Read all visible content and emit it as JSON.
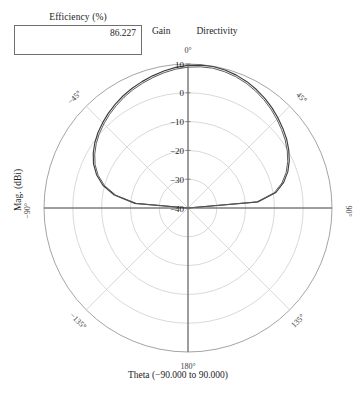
{
  "efficiency": {
    "title": "Efficiency (%)",
    "value": "86.227"
  },
  "legend": {
    "items": [
      {
        "label": "Gain",
        "color": "#555555"
      },
      {
        "label": "Directivity",
        "color": "#3d3d3d"
      }
    ]
  },
  "axes": {
    "x_title": "Theta (−90.000 to 90.000)",
    "y_title": "Mag. (dBi)"
  },
  "chart_data": {
    "type": "line",
    "subtype": "polar",
    "title": "",
    "xlabel": "Theta (−90.000 to 90.000)",
    "ylabel": "Mag. (dBi)",
    "radial_ticks": [
      10,
      0,
      -10,
      -20,
      -30,
      -40
    ],
    "radial_tick_labels": [
      "10",
      "0",
      "−10",
      "−20",
      "−30",
      "−40"
    ],
    "rlim": [
      -40,
      10
    ],
    "angular_ticks": [
      0,
      45,
      90,
      135,
      180,
      -135,
      -90,
      -45
    ],
    "angular_tick_labels": [
      "0°",
      "45°",
      "90°",
      "135°",
      "180°",
      "−135°",
      "−90°",
      "−45°"
    ],
    "angular_direction": "clockwise",
    "angular_zero_location": "top",
    "grid": true,
    "legend_position": "top",
    "theta_deg": [
      -90,
      -85,
      -80,
      -75,
      -70,
      -65,
      -60,
      -55,
      -50,
      -45,
      -40,
      -35,
      -30,
      -25,
      -20,
      -15,
      -10,
      -5,
      0,
      5,
      10,
      15,
      20,
      25,
      30,
      35,
      40,
      45,
      50,
      55,
      60,
      65,
      70,
      75,
      80,
      85,
      90
    ],
    "series": [
      {
        "name": "Directivity",
        "color": "#3d3d3d",
        "values": [
          -40.0,
          -21.5,
          -14.0,
          -9.4,
          -6.2,
          -3.8,
          -2.0,
          -0.5,
          0.8,
          1.9,
          3.0,
          4.0,
          5.0,
          5.9,
          6.7,
          7.5,
          8.3,
          9.0,
          9.5,
          9.8,
          9.9,
          9.6,
          9.1,
          8.4,
          7.5,
          6.5,
          5.4,
          4.2,
          3.0,
          1.8,
          0.4,
          -1.2,
          -3.1,
          -5.6,
          -9.0,
          -15.5,
          -40.0
        ]
      },
      {
        "name": "Gain",
        "color": "#555555",
        "values": [
          -40.0,
          -22.1,
          -14.6,
          -10.0,
          -6.8,
          -4.4,
          -2.6,
          -1.1,
          0.2,
          1.3,
          2.4,
          3.4,
          4.4,
          5.3,
          6.1,
          6.9,
          7.7,
          8.4,
          8.9,
          9.2,
          9.3,
          9.0,
          8.5,
          7.8,
          6.9,
          5.9,
          4.8,
          3.6,
          2.4,
          1.2,
          -0.2,
          -1.8,
          -3.7,
          -6.2,
          -9.6,
          -16.1,
          -40.0
        ]
      }
    ]
  }
}
